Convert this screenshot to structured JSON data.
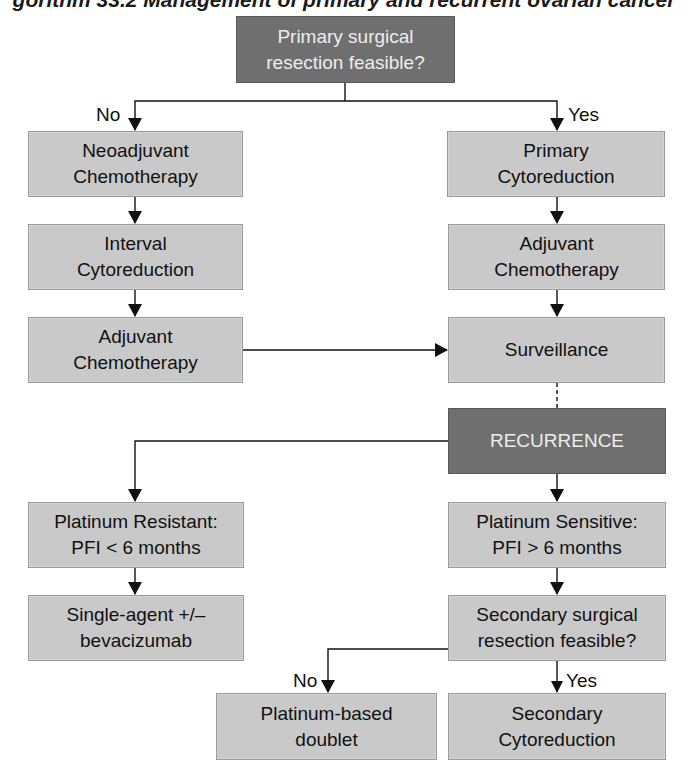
{
  "title": "gorithm 33.2  Management of primary and recurrent ovarian cancer",
  "colors": {
    "decision_box": "#6f6f6f",
    "process_box": "#c9c9c9",
    "line": "#111111"
  },
  "nodes": {
    "primary_resection": "Primary surgical resection feasible?",
    "neoadjuvant": "Neoadjuvant Chemotherapy",
    "interval_cytoreduction": "Interval Cytoreduction",
    "adjuvant_left": "Adjuvant Chemotherapy",
    "primary_cytoreduction": "Primary Cytoreduction",
    "adjuvant_right": "Adjuvant Chemotherapy",
    "surveillance": "Surveillance",
    "recurrence": "RECURRENCE",
    "platinum_resistant": "Platinum Resistant: PFI < 6 months",
    "single_agent": "Single-agent +/– bevacizumab",
    "platinum_sensitive": "Platinum Sensitive: PFI > 6 months",
    "secondary_resection": "Secondary surgical resection feasible?",
    "platinum_doublet": "Platinum-based doublet",
    "secondary_cytoreduction": "Secondary Cytoreduction"
  },
  "edge_labels": {
    "no_1": "No",
    "yes_1": "Yes",
    "no_2": "No",
    "yes_2": "Yes"
  }
}
